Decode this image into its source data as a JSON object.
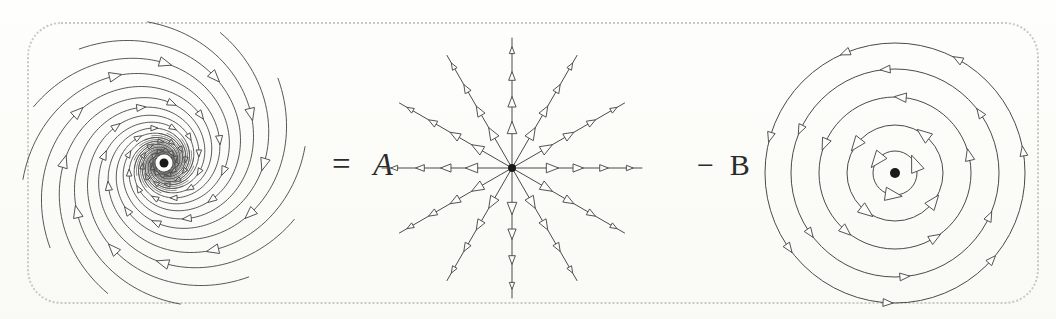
{
  "figure": {
    "kind": "vector-field-decomposition",
    "background_color": "#fdfdfb",
    "ink_color": "#4a4a4a",
    "frame": {
      "style": "dotted",
      "color": "#c9c9c4",
      "corner_radius_px": 34
    }
  },
  "equation": {
    "equals_sign": "=",
    "coefficient_a": "A",
    "minus_sign": "−",
    "coefficient_b": "B",
    "equals_a_text": "= A",
    "minus_b_text": "− B",
    "reading": "spiral field = A × radial field − B × circular field"
  },
  "chart_data": {
    "type": "scatter",
    "title": "",
    "subtitle": "",
    "xlabel": "",
    "ylabel": "",
    "grid": false,
    "legend_position": "none",
    "panels": [
      {
        "id": "spiral-field",
        "name": "logarithmic-spiral-field",
        "center": [
          164,
          163
        ],
        "arm_count": 12,
        "turns": 1.15,
        "inner_radius": 3,
        "outer_radius": 142,
        "growth_b": 0.3,
        "direction": "inward-counterclockwise",
        "arrowheads_per_arm": 6,
        "center_dot_radius": 4.5,
        "has_dense_core": true
      },
      {
        "id": "radial-field",
        "name": "radial-source-field",
        "center": [
          512,
          168
        ],
        "spoke_count": 12,
        "spoke_angle_step_deg": 30,
        "spoke_length": 130,
        "direction": "outward",
        "arrowheads_per_spoke": 4,
        "center_dot_radius": 4
      },
      {
        "id": "circular-field",
        "name": "circular-rotation-field",
        "center": [
          895,
          173
        ],
        "circle_count": 5,
        "circle_radii": [
          22,
          48,
          76,
          104,
          130
        ],
        "direction": "counterclockwise",
        "arrowheads_per_circle": [
          3,
          4,
          5,
          6,
          7
        ],
        "center_dot_radius": 5
      }
    ]
  }
}
